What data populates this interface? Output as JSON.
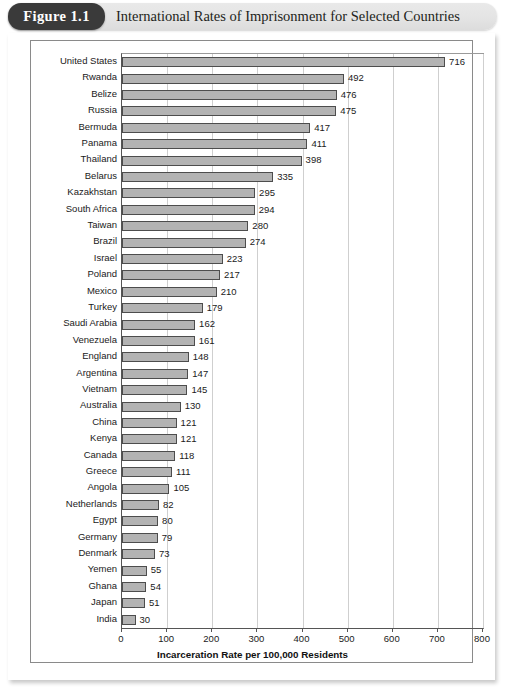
{
  "figure": {
    "badge_label": "Figure 1.1",
    "title": "International Rates of Imprisonment for Selected Countries"
  },
  "chart_data": {
    "type": "bar",
    "orientation": "horizontal",
    "title": "International Rates of Imprisonment for Selected Countries",
    "xlabel": "Incarceration Rate per 100,000 Residents",
    "ylabel": "",
    "xlim": [
      0,
      800
    ],
    "xticks": [
      0,
      100,
      200,
      300,
      400,
      500,
      600,
      700,
      800
    ],
    "grid": true,
    "legend": false,
    "bar_color": "#b3b3b3",
    "bar_edge_color": "#4d4d4d",
    "categories": [
      "United States",
      "Rwanda",
      "Belize",
      "Russia",
      "Bermuda",
      "Panama",
      "Thailand",
      "Belarus",
      "Kazakhstan",
      "South Africa",
      "Taiwan",
      "Brazil",
      "Israel",
      "Poland",
      "Mexico",
      "Turkey",
      "Saudi Arabia",
      "Venezuela",
      "England",
      "Argentina",
      "Vietnam",
      "Australia",
      "China",
      "Kenya",
      "Canada",
      "Greece",
      "Angola",
      "Netherlands",
      "Egypt",
      "Germany",
      "Denmark",
      "Yemen",
      "Ghana",
      "Japan",
      "India"
    ],
    "values": [
      716,
      492,
      476,
      475,
      417,
      411,
      398,
      335,
      295,
      294,
      280,
      274,
      223,
      217,
      210,
      179,
      162,
      161,
      148,
      147,
      145,
      130,
      121,
      121,
      118,
      111,
      105,
      82,
      80,
      79,
      73,
      55,
      54,
      51,
      30
    ]
  }
}
